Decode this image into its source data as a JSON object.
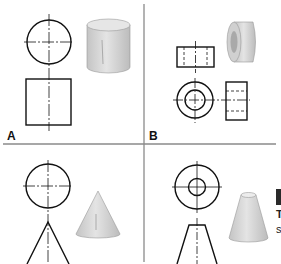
{
  "panels": [
    {
      "label": "A",
      "shape": "cylinder"
    },
    {
      "label": "B",
      "shape": "ring"
    },
    {
      "label": "",
      "shape": "cone"
    },
    {
      "label": "",
      "shape": "frustum"
    }
  ],
  "side_text": {
    "line1": "T",
    "line2": "s"
  },
  "colors": {
    "line": "#111111",
    "divider": "#8a8a8a",
    "shade_light": "#e2e2e2",
    "shade_dark": "#b9b9b9"
  }
}
